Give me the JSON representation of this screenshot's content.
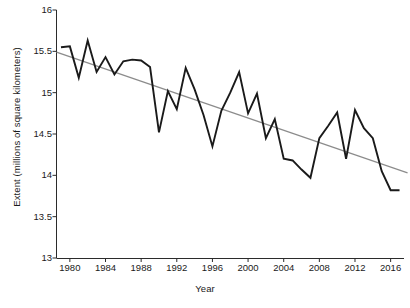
{
  "chart_data": {
    "type": "line",
    "title": "",
    "xlabel": "Year",
    "ylabel": "Extent (millions of square kilometers)",
    "xlim": [
      1978.5,
      2017.5
    ],
    "ylim": [
      13,
      16
    ],
    "grid": false,
    "legend": "none",
    "x_ticks": [
      1980,
      1984,
      1988,
      1992,
      1996,
      2000,
      2004,
      2008,
      2012,
      2016
    ],
    "x_tick_labels": [
      "1980",
      "1984",
      "1988",
      "1992",
      "1996",
      "2000",
      "2004",
      "2008",
      "2012",
      "2016"
    ],
    "y_ticks": [
      13,
      13.5,
      14,
      14.5,
      15,
      15.5,
      16
    ],
    "y_tick_labels": [
      "13",
      "13.5",
      "14",
      "14.5",
      "15",
      "15.5",
      "16"
    ],
    "x": [
      1979,
      1980,
      1981,
      1982,
      1983,
      1984,
      1985,
      1986,
      1987,
      1988,
      1989,
      1990,
      1991,
      1992,
      1993,
      1994,
      1995,
      1996,
      1997,
      1998,
      1999,
      2000,
      2001,
      2002,
      2003,
      2004,
      2005,
      2006,
      2007,
      2008,
      2009,
      2010,
      2011,
      2012,
      2013,
      2014,
      2015,
      2016,
      2017
    ],
    "series": [
      {
        "name": "Sea ice extent",
        "color": "#1a1a1a",
        "width": 1.9,
        "values": [
          15.55,
          15.56,
          15.18,
          15.63,
          15.25,
          15.43,
          15.22,
          15.38,
          15.4,
          15.39,
          15.31,
          14.52,
          15.02,
          14.8,
          15.3,
          15.04,
          14.73,
          14.35,
          14.78,
          15.0,
          15.25,
          14.75,
          14.99,
          14.45,
          14.68,
          14.2,
          14.18,
          14.07,
          13.97,
          14.45,
          14.6,
          14.76,
          14.2,
          14.79,
          14.57,
          14.45,
          14.05,
          13.82,
          13.82
        ]
      },
      {
        "name": "Linear trend",
        "color": "#8c8c8c",
        "width": 1.3,
        "type": "trend",
        "endpoints": [
          {
            "x": 1978.5,
            "y": 15.49
          },
          {
            "x": 2017.9,
            "y": 14.03
          }
        ]
      }
    ]
  },
  "axes": {
    "y_label": "Extent (millions of square kilometers)",
    "x_label": "Year"
  }
}
